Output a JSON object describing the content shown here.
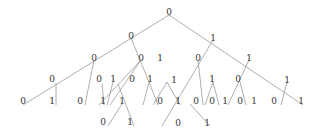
{
  "diagram": {
    "type": "binary-tree",
    "line_color": "#9a9a9a",
    "text_color": "#333333",
    "edges": [
      [
        169,
        15,
        23,
        105
      ],
      [
        169,
        15,
        303,
        105
      ],
      [
        131,
        38,
        149,
        82
      ],
      [
        149,
        82,
        158,
        105
      ],
      [
        149,
        82,
        143,
        105
      ],
      [
        94,
        60,
        85,
        105
      ],
      [
        56,
        83,
        56,
        105
      ],
      [
        141,
        60,
        99,
        105
      ],
      [
        141,
        60,
        110,
        105
      ],
      [
        102,
        84,
        104,
        105
      ],
      [
        113,
        82,
        107,
        105
      ],
      [
        118,
        84,
        134,
        126
      ],
      [
        122,
        104,
        108,
        126
      ],
      [
        213,
        40,
        162,
        126
      ],
      [
        198,
        60,
        203,
        105
      ],
      [
        190,
        104,
        210,
        126
      ],
      [
        167,
        82,
        180,
        105
      ],
      [
        167,
        82,
        153,
        105
      ],
      [
        213,
        82,
        219,
        105
      ],
      [
        213,
        82,
        205,
        105
      ],
      [
        249,
        60,
        228,
        105
      ],
      [
        240,
        82,
        246,
        105
      ],
      [
        287,
        82,
        281,
        105
      ]
    ],
    "nodes": [
      {
        "label": "0",
        "x": 169,
        "y": 12
      },
      {
        "label": "0",
        "x": 131,
        "y": 36
      },
      {
        "label": "1",
        "x": 213,
        "y": 38
      },
      {
        "label": "0",
        "x": 94,
        "y": 58
      },
      {
        "label": "0",
        "x": 141,
        "y": 58
      },
      {
        "label": "1",
        "x": 160,
        "y": 58
      },
      {
        "label": "0",
        "x": 198,
        "y": 58
      },
      {
        "label": "1",
        "x": 249,
        "y": 58
      },
      {
        "label": "0",
        "x": 52,
        "y": 79
      },
      {
        "label": "0",
        "x": 99,
        "y": 79
      },
      {
        "label": "1",
        "x": 113,
        "y": 79
      },
      {
        "label": "0",
        "x": 132,
        "y": 79
      },
      {
        "label": "1",
        "x": 150,
        "y": 79
      },
      {
        "label": "1",
        "x": 174,
        "y": 80
      },
      {
        "label": "1",
        "x": 212,
        "y": 79
      },
      {
        "label": "0",
        "x": 238,
        "y": 79
      },
      {
        "label": "1",
        "x": 287,
        "y": 80
      },
      {
        "label": "0",
        "x": 23,
        "y": 101
      },
      {
        "label": "1",
        "x": 52,
        "y": 101
      },
      {
        "label": "0",
        "x": 80,
        "y": 101
      },
      {
        "label": "1",
        "x": 103,
        "y": 101
      },
      {
        "label": "1",
        "x": 122,
        "y": 101
      },
      {
        "label": "0",
        "x": 160,
        "y": 101
      },
      {
        "label": "1",
        "x": 178,
        "y": 101
      },
      {
        "label": "0",
        "x": 196,
        "y": 101
      },
      {
        "label": "0",
        "x": 212,
        "y": 101
      },
      {
        "label": "1",
        "x": 225,
        "y": 101
      },
      {
        "label": "0",
        "x": 240,
        "y": 101
      },
      {
        "label": "1",
        "x": 254,
        "y": 101
      },
      {
        "label": "0",
        "x": 274,
        "y": 101
      },
      {
        "label": "1",
        "x": 301,
        "y": 101
      },
      {
        "label": "0",
        "x": 103,
        "y": 122
      },
      {
        "label": "1",
        "x": 130,
        "y": 122
      },
      {
        "label": "0",
        "x": 178,
        "y": 123
      },
      {
        "label": "1",
        "x": 207,
        "y": 123
      }
    ]
  }
}
